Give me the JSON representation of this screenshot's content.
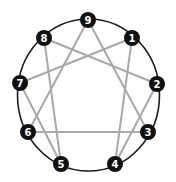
{
  "diagram": {
    "colors": {
      "circle": "#1a1a1a",
      "lines": "#a8a8a8",
      "node_fill": "#111111",
      "node_text": "#ffffff",
      "background": "#ffffff"
    },
    "circle": {
      "cx": 88.5,
      "cy": 95,
      "rx": 71,
      "ry": 76
    },
    "nodes": [
      {
        "id": "9",
        "label": "9",
        "x": 88,
        "y": 20
      },
      {
        "id": "1",
        "label": "1",
        "x": 132,
        "y": 38
      },
      {
        "id": "2",
        "label": "2",
        "x": 157,
        "y": 84
      },
      {
        "id": "3",
        "label": "3",
        "x": 148,
        "y": 132
      },
      {
        "id": "4",
        "label": "4",
        "x": 115,
        "y": 164
      },
      {
        "id": "5",
        "label": "5",
        "x": 61,
        "y": 164
      },
      {
        "id": "6",
        "label": "6",
        "x": 28,
        "y": 132
      },
      {
        "id": "7",
        "label": "7",
        "x": 20,
        "y": 83
      },
      {
        "id": "8",
        "label": "8",
        "x": 44,
        "y": 38
      }
    ],
    "edges": [
      {
        "from": "9",
        "to": "3"
      },
      {
        "from": "3",
        "to": "6"
      },
      {
        "from": "6",
        "to": "9"
      },
      {
        "from": "1",
        "to": "4"
      },
      {
        "from": "4",
        "to": "2"
      },
      {
        "from": "2",
        "to": "8"
      },
      {
        "from": "8",
        "to": "5"
      },
      {
        "from": "5",
        "to": "7"
      },
      {
        "from": "7",
        "to": "1"
      }
    ]
  }
}
